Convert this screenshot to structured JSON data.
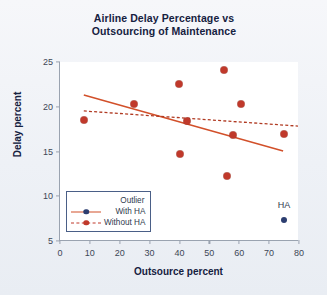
{
  "chart_data": {
    "type": "scatter",
    "title": "Airline Delay Percentage vs Outsourcing of Maintenance",
    "title_line1": "Airline Delay Percentage vs",
    "title_line2": "Outsourcing of Maintenance",
    "xlabel": "Outsource percent",
    "ylabel": "Delay percent",
    "xlim": [
      0,
      80
    ],
    "ylim": [
      5,
      25
    ],
    "xticks": [
      0,
      10,
      20,
      30,
      40,
      50,
      60,
      70,
      80
    ],
    "yticks": [
      5,
      10,
      15,
      20,
      25
    ],
    "grid": false,
    "legend_position": "lower-left",
    "legend": {
      "header": "Outlier",
      "entries": [
        {
          "label": "With HA",
          "marker_color": "#2c3e70",
          "line_color": "#d2502a",
          "line_style": "solid"
        },
        {
          "label": "Without HA",
          "marker_color": "#c0392b",
          "line_color": "#c0392b",
          "line_style": "dashed"
        }
      ]
    },
    "series": [
      {
        "name": "Without HA",
        "marker_color": "#c0392b",
        "points": [
          {
            "x": 8,
            "y": 18.5
          },
          {
            "x": 24.8,
            "y": 20.3
          },
          {
            "x": 39.8,
            "y": 22.5
          },
          {
            "x": 40,
            "y": 14.7
          },
          {
            "x": 42.5,
            "y": 18.4
          },
          {
            "x": 55,
            "y": 24.1
          },
          {
            "x": 56,
            "y": 12.3
          },
          {
            "x": 57.8,
            "y": 16.8
          },
          {
            "x": 60.5,
            "y": 20.3
          },
          {
            "x": 75,
            "y": 17.0
          }
        ]
      },
      {
        "name": "With HA outlier",
        "marker_color": "#2c3e70",
        "points": [
          {
            "x": 75,
            "y": 7.3
          }
        ]
      }
    ],
    "annotations": [
      {
        "text": "HA",
        "x": 75,
        "y": 9.0
      }
    ],
    "fit_lines": [
      {
        "name": "With HA",
        "style": "solid",
        "color": "#d2502a",
        "x0": 8,
        "y0": 21.3,
        "x1": 75,
        "y1": 15.0
      },
      {
        "name": "Without HA",
        "style": "dashed",
        "color": "#b03a22",
        "x0": 8,
        "y0": 19.5,
        "x1": 80,
        "y1": 17.8
      }
    ]
  }
}
